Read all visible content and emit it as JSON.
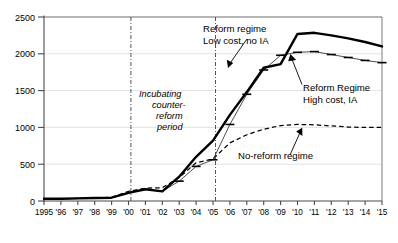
{
  "chart_data": {
    "type": "line",
    "title": "",
    "xlabel": "",
    "ylabel": "",
    "xlim": [
      1995,
      2015
    ],
    "ylim": [
      0,
      2500
    ],
    "yticks": [
      0,
      500,
      1000,
      1500,
      2000,
      2500
    ],
    "ytick_labels": [
      "0",
      "500",
      "1000",
      "1500",
      "2000",
      "2500"
    ],
    "x": [
      1995,
      1996,
      1997,
      1998,
      1999,
      2000,
      2001,
      2002,
      2003,
      2004,
      2005,
      2006,
      2007,
      2008,
      2009,
      2010,
      2011,
      2012,
      2013,
      2014,
      2015
    ],
    "xtick_labels": [
      "1995",
      "'96",
      "'97",
      "'98",
      "'99",
      "'00",
      "'01",
      "'02",
      "'03",
      "'04",
      "'05",
      "'06",
      "'07",
      "'08",
      "'09",
      "'10",
      "'11",
      "'12",
      "'13",
      "'14",
      "'15"
    ],
    "grid": true,
    "legend": "annotations",
    "series": [
      {
        "name": "Reform regime Low cost, no IA",
        "style": "thick-solid",
        "values": [
          30,
          30,
          35,
          40,
          45,
          110,
          160,
          130,
          330,
          600,
          820,
          1170,
          1480,
          1810,
          1860,
          2270,
          2285,
          2250,
          2210,
          2160,
          2100
        ]
      },
      {
        "name": "Reform Regime High cost, IA",
        "style": "thin-with-tickmarks",
        "values": [
          30,
          30,
          35,
          40,
          45,
          110,
          160,
          130,
          270,
          470,
          560,
          1040,
          1450,
          1780,
          1980,
          2020,
          2030,
          1990,
          1950,
          1910,
          1880
        ]
      },
      {
        "name": "No-reform regime",
        "style": "dashed",
        "values": [
          30,
          30,
          35,
          40,
          50,
          130,
          175,
          180,
          320,
          520,
          570,
          790,
          900,
          975,
          1025,
          1040,
          1035,
          1020,
          1005,
          1000,
          1000
        ]
      }
    ],
    "vertical_markers": [
      {
        "x": 2000,
        "style": "dash-dot"
      },
      {
        "x": 2005,
        "style": "dash-dot"
      }
    ],
    "annotations": [
      {
        "id": "reform-low-cost",
        "lines": [
          "Reform regime",
          "Low cost, no IA"
        ],
        "italic": false
      },
      {
        "id": "reform-high-cost",
        "lines": [
          "Reform Regime",
          "High cost, IA"
        ],
        "italic": false
      },
      {
        "id": "no-reform",
        "lines": [
          "No-reform regime"
        ],
        "italic": false
      },
      {
        "id": "incubating",
        "lines": [
          "Incubating",
          "counter-",
          "reform",
          "period"
        ],
        "italic": true
      }
    ]
  },
  "colors": {
    "background": "#ffffff",
    "line": "#000000",
    "grid": "#e2e2e2",
    "axis": "#4a4a4a"
  }
}
